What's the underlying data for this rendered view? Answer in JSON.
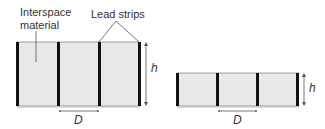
{
  "labels": {
    "interspace_line1": "Interspace",
    "interspace_line2": "material",
    "lead_strips": "Lead strips",
    "height_tall": "h",
    "spacing_tall": "D",
    "height_short": "h",
    "spacing_short": "D"
  },
  "colors": {
    "interspace_fill": "#e8e8e8",
    "lead_strip": "#111111",
    "outline": "#777777",
    "arrow": "#555555"
  }
}
